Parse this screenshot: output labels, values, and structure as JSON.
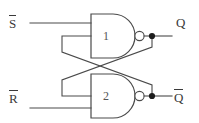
{
  "diagram": {
    "type": "logic-circuit",
    "colors": {
      "background": "#ffffff",
      "wire": "#4a4a4a",
      "gate_outline": "#4a4a4a",
      "junction": "#1d1d1d",
      "label_text": "#3a3a3a",
      "gate_number_text": "#555555"
    },
    "inputs": [
      {
        "id": "s-bar",
        "base": "S",
        "overbar": true,
        "label": "S̅",
        "active_low": true
      },
      {
        "id": "r-bar",
        "base": "R",
        "overbar": true,
        "label": "R̅",
        "active_low": true
      }
    ],
    "outputs": [
      {
        "id": "q",
        "base": "Q",
        "overbar": false,
        "label": "Q"
      },
      {
        "id": "q-bar",
        "base": "Q",
        "overbar": true,
        "label": "Q̅"
      }
    ],
    "gates": [
      {
        "id": "gate-1",
        "number": "1",
        "kind": "NAND",
        "inputs": [
          "S̅",
          "Q̅"
        ],
        "output": "Q"
      },
      {
        "id": "gate-2",
        "number": "2",
        "kind": "NAND",
        "inputs": [
          "Q",
          "R̅"
        ],
        "output": "Q̅"
      }
    ],
    "junctions": [
      {
        "id": "junction-q",
        "on_net": "Q"
      },
      {
        "id": "junction-qbar",
        "on_net": "Q̅"
      }
    ],
    "feedback": [
      {
        "from": "Q",
        "to": "gate-2",
        "input_index": 0
      },
      {
        "from": "Q̅",
        "to": "gate-1",
        "input_index": 1
      }
    ]
  }
}
